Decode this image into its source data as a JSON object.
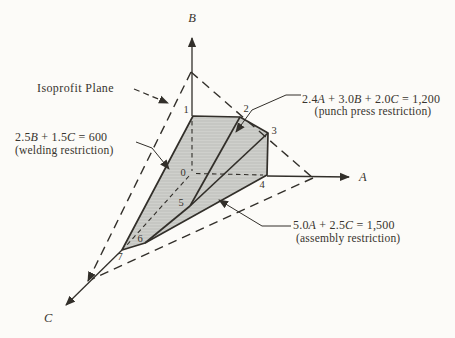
{
  "figure": {
    "type": "3d-linear-programming-feasible-region",
    "colors": {
      "ink": "#322f2a",
      "region_fill": "#c6c7c3",
      "paper": "#fcfbf8"
    },
    "axes": {
      "vertical": "B",
      "horizontal": "A",
      "depth": "C"
    },
    "isoprofit_label": "Isoprofit Plane",
    "constraints": {
      "punch": {
        "eq": [
          "2.4",
          "A",
          " + 3.0",
          "B",
          " + 2.0",
          "C",
          " = 1,200"
        ],
        "name": "(punch press restriction)"
      },
      "welding": {
        "eq": [
          "2.5",
          "B",
          " + 1.5",
          "C",
          " = 600"
        ],
        "name": "(welding restriction)"
      },
      "assembly": {
        "eq": [
          "5.0",
          "A",
          " + 2.5",
          "C",
          " = 1,500"
        ],
        "name": "(assembly restriction)"
      }
    },
    "vertex_labels": [
      "0",
      "1",
      "2",
      "3",
      "4",
      "5",
      "6",
      "7"
    ]
  }
}
